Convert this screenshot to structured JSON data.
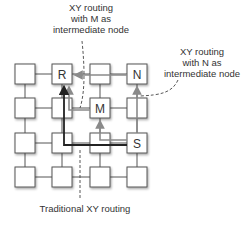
{
  "diagram": {
    "grid": {
      "rows": 4,
      "cols": 4
    },
    "nodes": {
      "R": {
        "label": "R",
        "row": 0,
        "col": 1
      },
      "N": {
        "label": "N",
        "row": 0,
        "col": 3
      },
      "M": {
        "label": "M",
        "row": 1,
        "col": 2
      },
      "S": {
        "label": "S",
        "row": 2,
        "col": 3
      }
    },
    "annotations": {
      "m_route": {
        "line1": "XY routing",
        "line2": "with M as",
        "line3": "intermediate node"
      },
      "n_route": {
        "line1": "XY routing",
        "line2": "with N as",
        "line3": "intermediate node"
      },
      "traditional": {
        "text": "Traditional XY routing"
      }
    },
    "colors": {
      "node_border": "#555555",
      "link": "#555555",
      "traditional_path": "#222222",
      "alt_path": "#8a8a8a"
    }
  }
}
